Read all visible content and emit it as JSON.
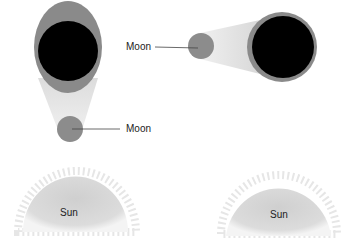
{
  "labels": {
    "moon_left": "Moon",
    "moon_right": "Moon",
    "sun_left": "Sun",
    "sun_right": "Sun"
  },
  "colors": {
    "earth_dark": "#000000",
    "penumbra": "#8a8a8a",
    "moon": "#8c8c8c",
    "shadow_cone": "#e4e4e4",
    "sun": "#d8d8d8"
  }
}
